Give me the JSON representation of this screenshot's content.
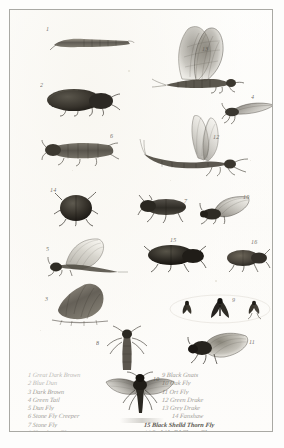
{
  "plate": {
    "title": "Plate of Angling Flies and Natural Insects",
    "paper_color": "#fdfdfc",
    "ink_color": "#3f3c36",
    "frame_color": "#a9a9a4"
  },
  "specimens": [
    {
      "id": 1,
      "label": "1",
      "name": "great-dark-brown-larva",
      "kind": "larva"
    },
    {
      "id": 2,
      "label": "2",
      "name": "blue-dun-beetle",
      "kind": "beetle"
    },
    {
      "id": 13,
      "label": "13",
      "name": "grey-drake-mayfly",
      "kind": "mayfly"
    },
    {
      "id": 6,
      "label": "6",
      "name": "stone-fly-creeper",
      "kind": "creeper"
    },
    {
      "id": 12,
      "label": "12",
      "name": "green-drake-mayfly",
      "kind": "mayfly"
    },
    {
      "id": 4,
      "label": "4",
      "name": "green-tail-fly",
      "kind": "small-fly"
    },
    {
      "id": 14,
      "label": "14",
      "name": "fanshaw-beetle",
      "kind": "round-beetle"
    },
    {
      "id": 7,
      "label": "7",
      "name": "stone-fly",
      "kind": "beetle"
    },
    {
      "id": 10,
      "label": "10",
      "name": "oak-fly-winged",
      "kind": "winged-fly"
    },
    {
      "id": 5,
      "label": "5",
      "name": "dun-fly",
      "kind": "winged-fly"
    },
    {
      "id": 15,
      "label": "15",
      "name": "black-shelld-thorn-fly",
      "kind": "beetle"
    },
    {
      "id": 16,
      "label": "16",
      "name": "red-shelld-thorn-fly",
      "kind": "beetle"
    },
    {
      "id": 3,
      "label": "3",
      "name": "dark-brown-larva",
      "kind": "grub"
    },
    {
      "id": 9,
      "label": "9",
      "name": "black-gnats",
      "kind": "gnat-group"
    },
    {
      "id": 8,
      "label": "8",
      "name": "hawthorn-fly",
      "kind": "slender-fly"
    },
    {
      "id": 11,
      "label": "11",
      "name": "ort-fly",
      "kind": "moth-fly"
    },
    {
      "id": 101,
      "label": "10",
      "name": "oak-fly-spread",
      "kind": "spread-moth"
    }
  ],
  "key": {
    "left_column": [
      {
        "number": "1",
        "text": "Great Dark Brown"
      },
      {
        "number": "2",
        "text": "Blue Dun"
      },
      {
        "number": "3",
        "text": "Dark Brown"
      },
      {
        "number": "4",
        "text": "Green Tail"
      },
      {
        "number": "5",
        "text": "Dun Fly"
      },
      {
        "number": "6",
        "text": "Stone Fly Creeper"
      },
      {
        "number": "7",
        "text": "Stone Fly"
      },
      {
        "number": "8",
        "text": "Hawthorn Flee"
      }
    ],
    "right_column": [
      {
        "number": "9",
        "text": "Black Gnats"
      },
      {
        "number": "10",
        "text": "Oak Fly"
      },
      {
        "number": "11",
        "text": "Ort Fly"
      },
      {
        "number": "12",
        "text": "Green Drake"
      },
      {
        "number": "13",
        "text": "Grey Drake"
      },
      {
        "number": "14",
        "text": "Fanshaw"
      },
      {
        "number": "15",
        "text": "Black Shelld Thorn Fly"
      },
      {
        "number": "16",
        "text": "Red Shelld Thorn Fly"
      }
    ]
  }
}
